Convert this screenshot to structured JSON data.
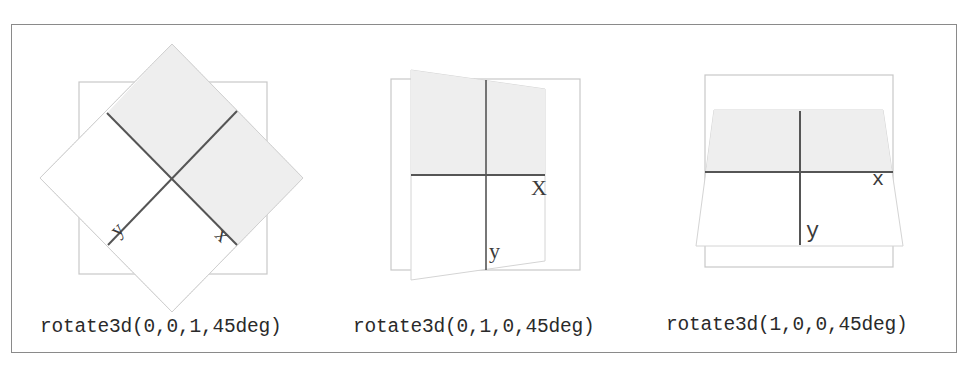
{
  "figure": {
    "frame_color": "#8a8a8a",
    "reference_box_color": "#c8c8c8",
    "shade_color": "#eeeeee",
    "axis_color": "#555555"
  },
  "panels": [
    {
      "id": "rotate-z",
      "caption": "rotate3d(0,0,1,45deg)",
      "x_label": "x",
      "y_label": "y",
      "transform_axis": "z",
      "angle_deg": 45
    },
    {
      "id": "rotate-y",
      "caption": "rotate3d(0,1,0,45deg)",
      "x_label": "X",
      "y_label": "y",
      "transform_axis": "y",
      "angle_deg": 45
    },
    {
      "id": "rotate-x",
      "caption": "rotate3d(1,0,0,45deg)",
      "x_label": "x",
      "y_label": "y",
      "transform_axis": "x",
      "angle_deg": 45
    }
  ]
}
